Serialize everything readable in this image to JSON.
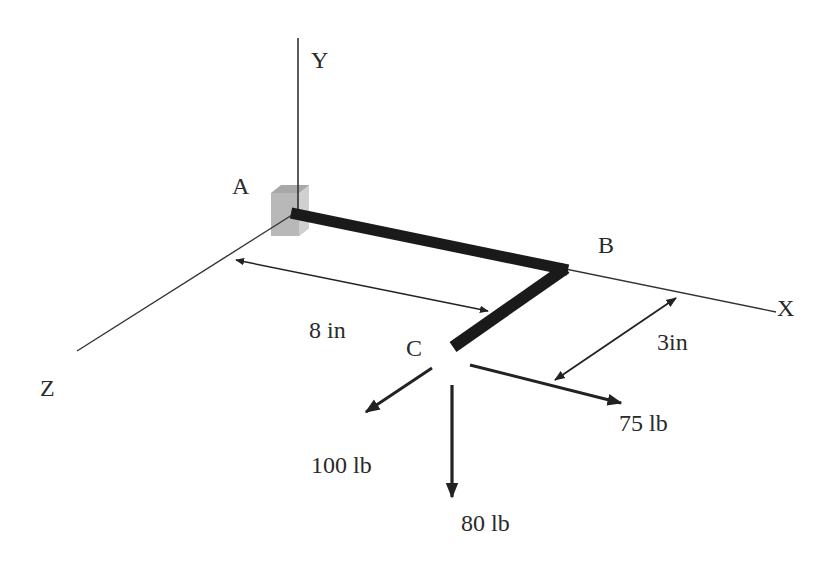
{
  "diagram": {
    "type": "3D statics free-body diagram (bent bar with forces)",
    "axes": {
      "x_label": "X",
      "y_label": "Y",
      "z_label": "Z"
    },
    "points": {
      "a_label": "A",
      "b_label": "B",
      "c_label": "C"
    },
    "dimensions": {
      "ab_length": "8 in",
      "bc_length": "3in"
    },
    "forces": {
      "force_z": "100 lb",
      "force_y": "80 lb",
      "force_x": "75 lb"
    },
    "colors": {
      "line": "#222222",
      "bar": "#1a1a1a",
      "support": "#9a9a9a",
      "background": "#ffffff"
    }
  }
}
